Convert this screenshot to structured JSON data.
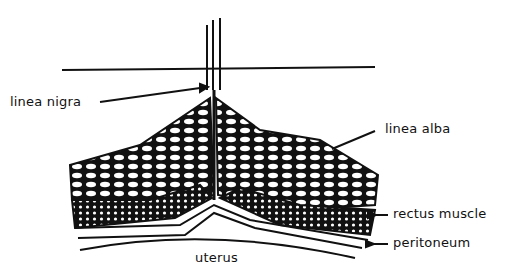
{
  "diagram": {
    "labels": {
      "linea_nigra": "linea nigra",
      "linea_alba": "linea alba",
      "rectus_muscle": "rectus muscle",
      "peritoneum": "peritoneum",
      "uterus": "uterus"
    },
    "colors": {
      "ink": "#111111",
      "background": "#ffffff"
    }
  }
}
